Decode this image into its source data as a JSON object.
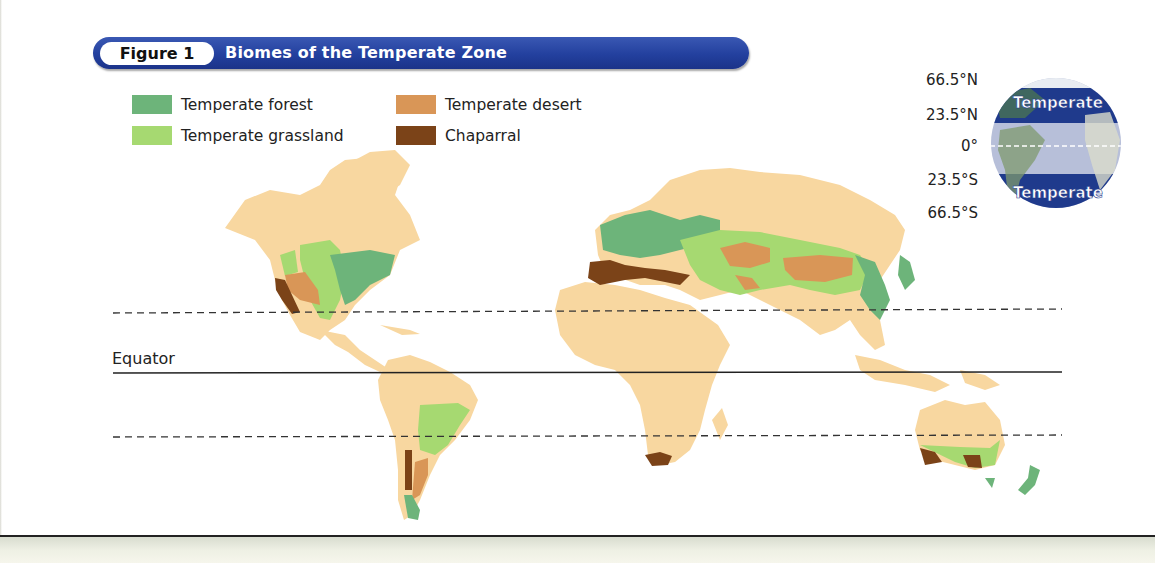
{
  "figure": {
    "label": "Figure 1",
    "title": "Biomes of the Temperate Zone"
  },
  "legend": [
    {
      "label": "Temperate forest",
      "color": "#6db47a"
    },
    {
      "label": "Temperate grassland",
      "color": "#a6d971"
    },
    {
      "label": "Temperate desert",
      "color": "#d99657"
    },
    {
      "label": "Chaparral",
      "color": "#7b4318"
    }
  ],
  "map": {
    "land_color": "#f8d7a0",
    "reference_lines": [
      {
        "name": "Tropic of Cancer",
        "latitude": "23.5°N",
        "style": "dashed"
      },
      {
        "name": "Equator",
        "latitude": "0°",
        "style": "solid",
        "label": "Equator"
      },
      {
        "name": "Tropic of Capricorn",
        "latitude": "23.5°S",
        "style": "dashed"
      }
    ],
    "regions": [
      {
        "continent": "North America",
        "biomes": [
          "Temperate forest",
          "Temperate grassland",
          "Temperate desert",
          "Chaparral"
        ]
      },
      {
        "continent": "South America",
        "biomes": [
          "Temperate grassland",
          "Temperate desert",
          "Chaparral",
          "Temperate forest"
        ]
      },
      {
        "continent": "Europe/Asia",
        "biomes": [
          "Temperate forest",
          "Temperate grassland",
          "Temperate desert",
          "Chaparral"
        ]
      },
      {
        "continent": "Africa",
        "biomes": [
          "Chaparral"
        ]
      },
      {
        "continent": "Australia",
        "biomes": [
          "Temperate grassland",
          "Chaparral",
          "Temperate forest"
        ]
      },
      {
        "continent": "New Zealand",
        "biomes": [
          "Temperate forest"
        ]
      }
    ]
  },
  "globe_inset": {
    "latitudes": [
      "66.5°N",
      "23.5°N",
      "0°",
      "23.5°S",
      "66.5°S"
    ],
    "zone_label_north": "Temperate",
    "zone_label_south": "Temperate",
    "band_color": "#1f3a8c",
    "tropic_tint": "#b7bfd9"
  }
}
